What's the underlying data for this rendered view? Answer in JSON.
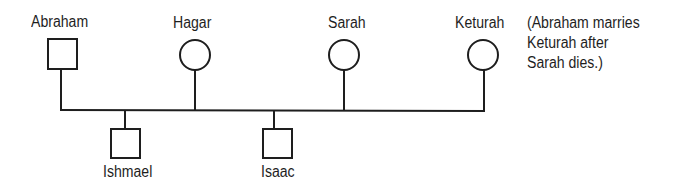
{
  "diagram": {
    "type": "pedigree",
    "people": [
      {
        "id": "abraham",
        "name": "Abraham",
        "sex": "male",
        "shape": "square"
      },
      {
        "id": "hagar",
        "name": "Hagar",
        "sex": "female",
        "shape": "circle"
      },
      {
        "id": "sarah",
        "name": "Sarah",
        "sex": "female",
        "shape": "circle"
      },
      {
        "id": "keturah",
        "name": "Keturah",
        "sex": "female",
        "shape": "circle"
      },
      {
        "id": "ishmael",
        "name": "Ishmael",
        "sex": "male",
        "shape": "square"
      },
      {
        "id": "isaac",
        "name": "Isaac",
        "sex": "male",
        "shape": "square"
      }
    ],
    "marriage_line": {
      "connects": [
        "Abraham",
        "Hagar",
        "Sarah",
        "Keturah"
      ]
    },
    "children": [
      {
        "name": "Ishmael",
        "parents": [
          "Abraham",
          "Hagar"
        ]
      },
      {
        "name": "Isaac",
        "parents": [
          "Abraham",
          "Sarah"
        ]
      }
    ],
    "note_lines": [
      "(Abraham marries",
      "Keturah after",
      "Sarah dies.)"
    ],
    "line_color": "#1e1e1e"
  }
}
